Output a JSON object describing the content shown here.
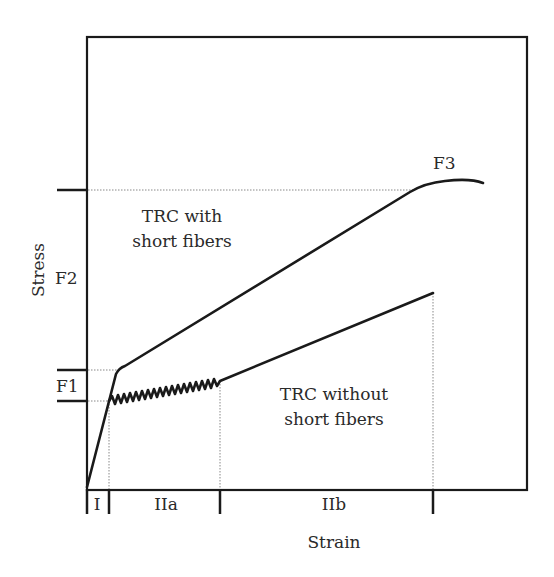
{
  "diagram": {
    "type": "stress-strain schematic",
    "axes": {
      "x_label": "Strain",
      "y_label": "Stress"
    },
    "stress_levels": {
      "F1": "F1",
      "F2": "F2",
      "F3": "F3"
    },
    "strain_regions": [
      "I",
      "IIa",
      "IIb"
    ],
    "curves": [
      {
        "name": "TRC with short fibers",
        "line1": "TRC with",
        "line2": "short fibers"
      },
      {
        "name": "TRC without short fibers",
        "line1": "TRC without",
        "line2": "short fibers"
      }
    ],
    "colors": {
      "line": "#1a1a1a",
      "guide": "#888888",
      "text": "#2a2a2a"
    }
  }
}
